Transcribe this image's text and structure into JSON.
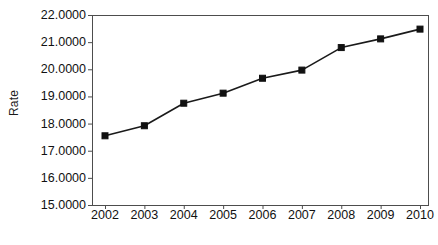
{
  "chart_data": {
    "type": "line",
    "title": "",
    "xlabel": "",
    "ylabel": "Rate",
    "categories": [
      "2002",
      "2003",
      "2004",
      "2005",
      "2006",
      "2007",
      "2008",
      "2009",
      "2010"
    ],
    "values": [
      17.55,
      17.92,
      18.75,
      19.12,
      19.67,
      19.97,
      20.8,
      21.12,
      21.48
    ],
    "series": [
      {
        "name": "Rate",
        "values": [
          17.55,
          17.92,
          18.75,
          19.12,
          19.67,
          19.97,
          20.8,
          21.12,
          21.48
        ]
      }
    ],
    "ylim": [
      15.0,
      22.0
    ],
    "y_tick_labels": [
      "22.0000",
      "21.0000",
      "20.0000",
      "19.0000",
      "18.0000",
      "17.0000",
      "16.0000",
      "15.0000"
    ],
    "y_tick_values": [
      22.0,
      21.0,
      20.0,
      19.0,
      18.0,
      17.0,
      16.0,
      15.0
    ],
    "x_tick_labels": [
      "2002",
      "2003",
      "2004",
      "2005",
      "2006",
      "2007",
      "2008",
      "2009",
      "2010"
    ],
    "grid": false,
    "legend": false,
    "legend_position": "none",
    "marker": "square",
    "line_color": "#1a1a1a",
    "marker_color": "#111111",
    "plot_background": "#ffffff",
    "axis_color": "#4d4d4d"
  },
  "caption": {
    "text": ""
  }
}
